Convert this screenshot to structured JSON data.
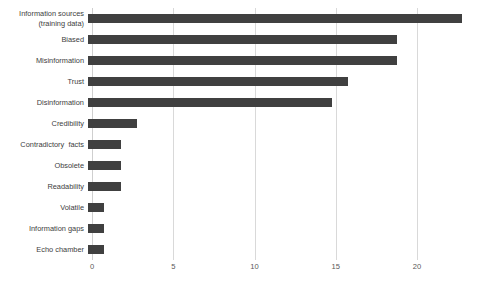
{
  "chart_data": {
    "type": "bar",
    "orientation": "horizontal",
    "title": "",
    "xlabel": "",
    "ylabel": "",
    "xlim": [
      0,
      20
    ],
    "xticks": [
      0,
      5,
      10,
      15,
      20
    ],
    "xtick_labels": [
      "0",
      "5",
      "10",
      "15",
      "20"
    ],
    "grid": "vertical",
    "legend": "none",
    "bar_color": "#404040",
    "gridline_color": "#d9d9d9",
    "background": "#ffffff",
    "categories": [
      "Information sources\n(training data)",
      "Biased",
      "Misinformation",
      "Trust",
      "Disinformation",
      "Credibility",
      "Contradictory  facts",
      "Obsolete",
      "Readability",
      "Volatile",
      "Information gaps",
      "Echo chamber"
    ],
    "values": [
      23,
      19,
      19,
      16,
      15,
      3,
      2,
      2,
      2,
      1,
      1,
      1
    ]
  }
}
